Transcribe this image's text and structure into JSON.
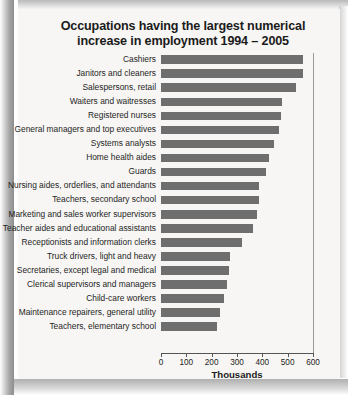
{
  "title": "Occupations having the largest numerical increase in employment 1994 – 2005",
  "axis_title": "Thousands",
  "chart_data": {
    "type": "bar",
    "orientation": "horizontal",
    "title": "Occupations having the largest numerical increase in employment 1994 – 2005",
    "xlabel": "Thousands",
    "ylabel": "",
    "xlim": [
      0,
      600
    ],
    "xticks": [
      0,
      100,
      200,
      300,
      400,
      500,
      600
    ],
    "xtick_labels": [
      "0",
      "100",
      "200",
      "300",
      "400",
      "500",
      "600"
    ],
    "grid": false,
    "legend": false,
    "bar_color": "#6e6e6e",
    "categories": [
      "Cashiers",
      "Janitors and cleaners",
      "Salespersons, retail",
      "Waiters and waitresses",
      "Registered nurses",
      "General managers and top executives",
      "Systems analysts",
      "Home health aides",
      "Guards",
      "Nursing aides, orderlies, and attendants",
      "Teachers, secondary school",
      "Marketing and sales worker supervisors",
      "Teacher aides and educational assistants",
      "Receptionists and information clerks",
      "Truck drivers, light and heavy",
      "Secretaries, except legal and medical",
      "Clerical supervisors and managers",
      "Child-care workers",
      "Maintenance repairers, general utility",
      "Teachers, elementary school"
    ],
    "values": [
      562,
      559,
      532,
      479,
      473,
      466,
      445,
      428,
      415,
      387,
      386,
      380,
      364,
      318,
      271,
      267,
      261,
      248,
      231,
      220
    ]
  }
}
